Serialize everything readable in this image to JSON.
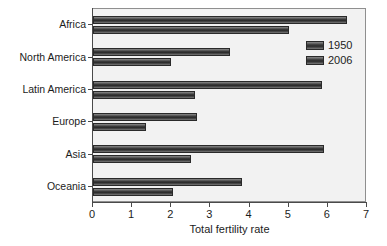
{
  "chart_data": {
    "type": "bar",
    "orientation": "horizontal",
    "title": "",
    "xlabel": "Total fertility rate",
    "ylabel": "",
    "xlim": [
      0,
      7
    ],
    "ylim": null,
    "grid": false,
    "legend_position": "top-right",
    "xticks": [
      "0",
      "1",
      "2",
      "3",
      "4",
      "5",
      "6",
      "7"
    ],
    "xtick_values": [
      0,
      1,
      2,
      3,
      4,
      5,
      6,
      7
    ],
    "categories": [
      "Africa",
      "North America",
      "Latin America",
      "Europe",
      "Asia",
      "Oceania"
    ],
    "series": [
      {
        "name": "1950",
        "color": "#3a3a3a",
        "values": [
          6.5,
          3.5,
          5.85,
          2.65,
          5.9,
          3.8
        ]
      },
      {
        "name": "2006",
        "color": "#3a3a3a",
        "values": [
          5.0,
          2.0,
          2.6,
          1.35,
          2.5,
          2.05
        ]
      }
    ]
  },
  "legend": {
    "entries": [
      {
        "label": "1950"
      },
      {
        "label": "2006"
      }
    ]
  },
  "axis": {
    "x_title": "Total fertility rate"
  },
  "colors": {
    "plot_background": "#f2f2f2",
    "page_background": "#ffffff",
    "axis": "#4a4a4a",
    "bar_dark": "#2c2c2c",
    "bar_light": "#8a8a8a",
    "text": "#1c1c1c"
  }
}
